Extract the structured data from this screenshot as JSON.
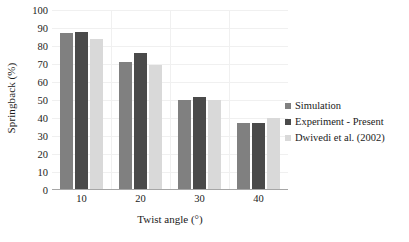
{
  "chart_data": {
    "type": "bar",
    "title": "",
    "subtitle": "",
    "xlabel": "Twist angle (°)",
    "ylabel": "Springback (%)",
    "categories": [
      "10",
      "20",
      "30",
      "40"
    ],
    "series": [
      {
        "name": "Simulation",
        "values": [
          87,
          71,
          50,
          37
        ],
        "color": "#808080"
      },
      {
        "name": "Experiment - Present",
        "values": [
          88,
          76,
          51.5,
          37
        ],
        "color": "#4a4a4a"
      },
      {
        "name": "Dwivedi et al. (2002)",
        "values": [
          84,
          69.5,
          50,
          40
        ],
        "color": "#d9d9d9"
      }
    ],
    "ylim": [
      0,
      100
    ],
    "y_ticks": [
      0,
      10,
      20,
      30,
      40,
      50,
      60,
      70,
      80,
      90,
      100
    ],
    "grid": "horizontal-and-vertical",
    "legend_position": "right"
  }
}
